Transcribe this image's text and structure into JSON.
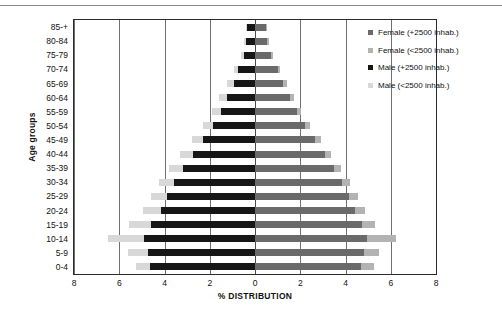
{
  "chart_data": {
    "type": "bar",
    "subtype": "population-pyramid",
    "title": "",
    "xlabel": "% DISTRIBUTION",
    "ylabel": "Age groups",
    "xlim": [
      -8,
      8
    ],
    "xticks": [
      8,
      6,
      4,
      2,
      0,
      2,
      4,
      6,
      8
    ],
    "xtick_values": [
      -8,
      -6,
      -4,
      -2,
      0,
      2,
      4,
      6,
      8
    ],
    "grid": true,
    "grid_axis": "x",
    "legend_position": "right",
    "orientation": "horizontal",
    "stacked": true,
    "categories": [
      "85-+",
      "80-84",
      "75-79",
      "70-74",
      "65-69",
      "60-64",
      "55-59",
      "50-54",
      "45-49",
      "40-44",
      "35-39",
      "30-34",
      "25-29",
      "20-24",
      "15-19",
      "10-14",
      "5-9",
      "0-4"
    ],
    "series": [
      {
        "name": "Male (+2500 inhab.)",
        "side": "left",
        "color": "#161616",
        "values": [
          0.35,
          0.4,
          0.5,
          0.75,
          0.95,
          1.25,
          1.5,
          1.85,
          2.3,
          2.75,
          3.2,
          3.6,
          3.9,
          4.15,
          4.6,
          4.9,
          4.75,
          4.65
        ]
      },
      {
        "name": "Male (<2500 inhab.)",
        "side": "left",
        "color": "#d8d8d8",
        "values": [
          0.05,
          0.08,
          0.12,
          0.2,
          0.3,
          0.35,
          0.4,
          0.45,
          0.5,
          0.55,
          0.6,
          0.65,
          0.7,
          0.8,
          0.95,
          1.6,
          0.85,
          0.6
        ]
      },
      {
        "name": "Female (+2500 inhab.)",
        "side": "right",
        "color": "#6a6a6a",
        "values": [
          0.5,
          0.55,
          0.7,
          1.0,
          1.25,
          1.55,
          1.85,
          2.2,
          2.65,
          3.1,
          3.5,
          3.85,
          4.15,
          4.4,
          4.75,
          4.95,
          4.8,
          4.7
        ]
      },
      {
        "name": "Female (<2500 inhab.)",
        "side": "right",
        "color": "#b3b3b3",
        "values": [
          0.05,
          0.06,
          0.08,
          0.1,
          0.15,
          0.18,
          0.2,
          0.22,
          0.25,
          0.28,
          0.3,
          0.35,
          0.4,
          0.45,
          0.55,
          1.3,
          0.7,
          0.55
        ]
      }
    ]
  },
  "legend": {
    "items": [
      {
        "label": "Female (+2500 inhab.)",
        "color": "#6a6a6a"
      },
      {
        "label": "Female (<2500 inhab.)",
        "color": "#b3b3b3"
      },
      {
        "label": "Male (+2500 inhab.)",
        "color": "#161616"
      },
      {
        "label": "Male (<2500 inhab.)",
        "color": "#d8d8d8"
      }
    ]
  }
}
